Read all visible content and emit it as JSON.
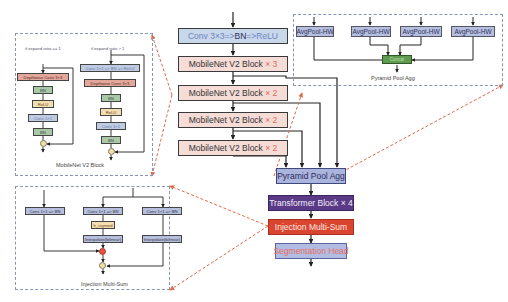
{
  "main_pipeline": {
    "stem": "Conv 3×3 => BN => ReLU",
    "stem_parts": {
      "conv": "Conv 3×3",
      "arrow1": " => ",
      "bn": "BN",
      "arrow2": " => ",
      "relu": "ReLU"
    },
    "mobilenet_blocks": [
      {
        "name": "MobileNet V2 Block",
        "mult": "× 3"
      },
      {
        "name": "MobileNet V2 Block",
        "mult": "× 2"
      },
      {
        "name": "MobileNet V2 Block",
        "mult": "× 2"
      },
      {
        "name": "MobileNet V2 Block",
        "mult": "× 2"
      }
    ],
    "pyramid_pool_agg": "Pyramid Pool Agg",
    "transformer": {
      "name": "Transformer Block",
      "mult": "× 4"
    },
    "injection": "Injection Multi-Sum",
    "seg_head": "Segmentation Head"
  },
  "ppa_panel": {
    "pools": [
      "AvgPool-HW",
      "AvgPool-HW",
      "AvgPool-HW",
      "AvgPool-HW"
    ],
    "concat": "Concat",
    "caption": "Pyramid Pool Agg"
  },
  "mbv2_panel": {
    "caption": "MobileNet V2 Block",
    "left": {
      "condition": "if expand ratio == 1",
      "layers": [
        "Depthwise Conv 3×3",
        "BN",
        "ReLU",
        "Conv 1×1",
        "BN"
      ]
    },
    "right": {
      "condition": "if expand ratio > 1",
      "layers": [
        "Conv 1×1 => BN => ReLU",
        "Depthwise Conv 3×3",
        "BN",
        "ReLU",
        "Conv 1×1",
        "BN"
      ]
    }
  },
  "injection_panel": {
    "caption": "Injection Multi-Sum",
    "branches": [
      {
        "conv": "Conv 1×1 => BN"
      },
      {
        "conv": "Conv 1×1 => BN",
        "act": "h_sigmoid",
        "interp": "Interpolate(bilinear)"
      },
      {
        "conv": "Conv 1×1 => BN",
        "interp": "Interpolate(bilinear)"
      }
    ]
  },
  "colors": {
    "arrow": "#222222",
    "dashed_link": "#e06a4a",
    "panel_border": "#8a93b8"
  }
}
